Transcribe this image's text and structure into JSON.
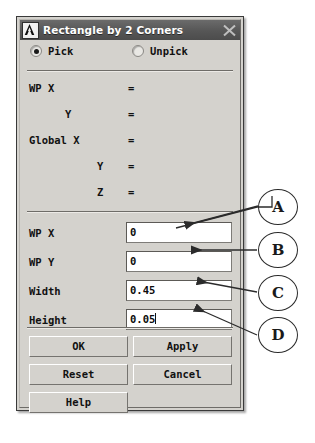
{
  "window": {
    "title": "Rectangle by 2 Corners",
    "logo_icon": "ansys-a-logo-icon",
    "close_icon": "close-icon"
  },
  "mode": {
    "options": [
      {
        "label": "Pick",
        "selected": true
      },
      {
        "label": "Unpick",
        "selected": false
      }
    ]
  },
  "readout": {
    "rows": [
      {
        "label": "WP X",
        "label_left": "9px",
        "eq": "=",
        "value": ""
      },
      {
        "label": "Y",
        "label_left": "45px",
        "eq": "=",
        "value": ""
      },
      {
        "label": "Global X",
        "label_left": "9px",
        "eq": "=",
        "value": ""
      },
      {
        "label": "Y",
        "label_left": "77px",
        "eq": "=",
        "value": ""
      },
      {
        "label": "Z",
        "label_left": "77px",
        "eq": "=",
        "value": ""
      }
    ]
  },
  "fields": [
    {
      "label": "WP X",
      "value": "0",
      "caret": false,
      "callout": "A"
    },
    {
      "label": "WP Y",
      "value": "0",
      "caret": false,
      "callout": "B"
    },
    {
      "label": "Width",
      "value": "0.45",
      "caret": false,
      "callout": "C"
    },
    {
      "label": "Height",
      "value": "0.05",
      "caret": true,
      "callout": "D"
    }
  ],
  "buttons": [
    {
      "label": "OK",
      "col": "col-l",
      "row": "r0"
    },
    {
      "label": "Apply",
      "col": "col-r",
      "row": "r0"
    },
    {
      "label": "Reset",
      "col": "col-l",
      "row": "r1"
    },
    {
      "label": "Cancel",
      "col": "col-r",
      "row": "r1"
    },
    {
      "label": "Help",
      "col": "col-l",
      "row": "r2"
    }
  ],
  "callouts": [
    {
      "id": "A",
      "letter": "A"
    },
    {
      "id": "B",
      "letter": "B"
    },
    {
      "id": "C",
      "letter": "C"
    },
    {
      "id": "D",
      "letter": "D"
    }
  ],
  "colors": {
    "dialog_face": "#d4d2cd",
    "titlebar": "#5c5c5c",
    "field_bg": "#ffffff",
    "text": "#111111",
    "annotation": "#2b2b2b"
  }
}
